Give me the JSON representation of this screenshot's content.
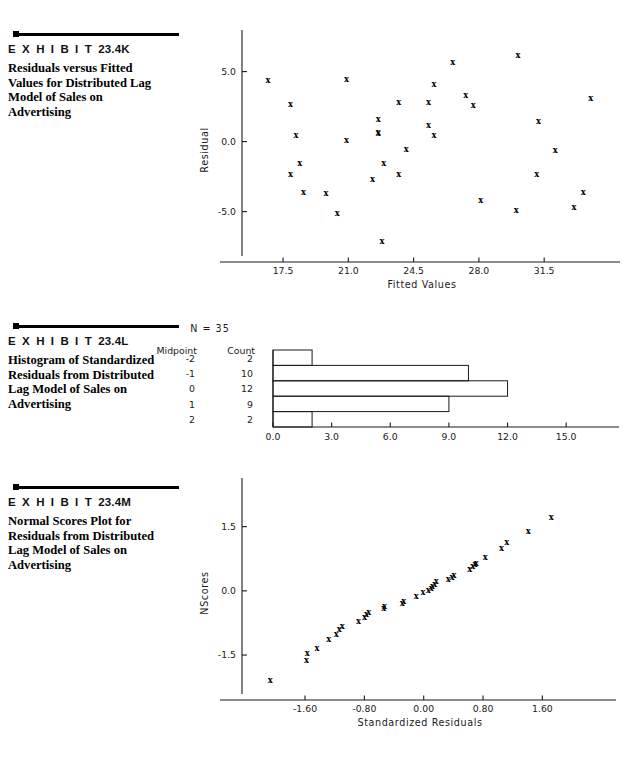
{
  "exhibits": [
    {
      "id": "23.4K",
      "label": "E X H I B I T",
      "number": "23.4K",
      "description": "Residuals versus Fitted Values for Distributed Lag Model of Sales on Advertising"
    },
    {
      "id": "23.4L",
      "label": "E X H I B I T",
      "number": "23.4L",
      "description": "Histogram of Standardized Residuals from Distributed Lag Model of Sales on Advertising"
    },
    {
      "id": "23.4M",
      "label": "E X H I B I T",
      "number": "23.4M",
      "description": "Normal Scores Plot for Residuals from Distributed Lag Model of Sales on Advertising"
    }
  ],
  "histogram_header": "N  =  35",
  "histogram_columns": {
    "midpoint": "Midpoint",
    "count": "Count"
  },
  "chart_data": [
    {
      "type": "scatter",
      "title": "Residuals versus Fitted Values for Distributed Lag Model of Sales on Advertising",
      "xlabel": "Fitted  Values",
      "ylabel": "Residual",
      "xlim": [
        15.3,
        34.6
      ],
      "ylim": [
        -8.6,
        7.4
      ],
      "xticks": [
        "17.5",
        "21.0",
        "24.5",
        "28.0",
        "31.5"
      ],
      "xtickvals": [
        17.5,
        21.0,
        24.5,
        28.0,
        31.5
      ],
      "yticks": [
        "5.0",
        "0.0",
        "-5.0"
      ],
      "ytickvals": [
        5.0,
        0.0,
        -5.0
      ],
      "grid": false,
      "marker": "x",
      "points": [
        [
          16.7,
          4.4
        ],
        [
          17.9,
          2.7
        ],
        [
          18.2,
          0.5
        ],
        [
          17.9,
          -2.3
        ],
        [
          18.4,
          -1.5
        ],
        [
          18.6,
          -3.6
        ],
        [
          19.8,
          -3.7
        ],
        [
          20.4,
          -5.1
        ],
        [
          20.9,
          4.5
        ],
        [
          20.9,
          0.1
        ],
        [
          22.3,
          -2.7
        ],
        [
          22.6,
          1.6
        ],
        [
          22.6,
          0.6
        ],
        [
          22.6,
          0.7
        ],
        [
          22.9,
          -1.5
        ],
        [
          22.8,
          -7.1
        ],
        [
          23.7,
          2.8
        ],
        [
          23.7,
          -2.3
        ],
        [
          24.1,
          -0.5
        ],
        [
          25.3,
          2.8
        ],
        [
          25.3,
          1.2
        ],
        [
          25.6,
          4.1
        ],
        [
          25.6,
          0.5
        ],
        [
          26.6,
          5.7
        ],
        [
          27.3,
          3.3
        ],
        [
          27.7,
          2.6
        ],
        [
          28.1,
          -4.2
        ],
        [
          30.1,
          6.2
        ],
        [
          30.0,
          -4.9
        ],
        [
          31.2,
          1.5
        ],
        [
          31.1,
          -2.3
        ],
        [
          32.1,
          -0.6
        ],
        [
          33.1,
          -4.7
        ],
        [
          33.6,
          -3.6
        ],
        [
          34.0,
          3.1
        ]
      ]
    },
    {
      "type": "bar",
      "orientation": "horizontal",
      "title": "Histogram of Standardized Residuals from Distributed Lag Model of Sales on Advertising",
      "categories": [
        "-2",
        "-1",
        "0",
        "1",
        "2"
      ],
      "values": [
        2,
        10,
        12,
        9,
        2
      ],
      "xlabel": "",
      "ylabel": "",
      "xticks": [
        "0.0",
        "3.0",
        "6.0",
        "9.0",
        "12.0",
        "15.0"
      ],
      "xtickvals": [
        0.0,
        3.0,
        6.0,
        9.0,
        12.0,
        15.0
      ],
      "xlim": [
        0,
        17.6
      ],
      "grid": false,
      "n": 35
    },
    {
      "type": "scatter",
      "title": "Normal Scores Plot for Residuals from Distributed Lag Model of Sales on Advertising",
      "xlabel": "Standardized  Residuals",
      "ylabel": "NScores",
      "xlim": [
        -2.45,
        2.35
      ],
      "ylim": [
        -2.55,
        2.45
      ],
      "xticks": [
        "-1.60",
        "-0.80",
        "0.00",
        "0.80",
        "1.60"
      ],
      "xtickvals": [
        -1.6,
        -0.8,
        0.0,
        0.8,
        1.6
      ],
      "yticks": [
        "1.5",
        "0.0",
        "-1.5"
      ],
      "ytickvals": [
        1.5,
        0.0,
        -1.5
      ],
      "grid": false,
      "marker": "x",
      "points": [
        [
          -2.07,
          -2.08
        ],
        [
          -1.58,
          -1.62
        ],
        [
          -1.57,
          -1.45
        ],
        [
          -1.44,
          -1.33
        ],
        [
          -1.28,
          -1.13
        ],
        [
          -1.18,
          -1.0
        ],
        [
          -1.14,
          -0.9
        ],
        [
          -1.1,
          -0.83
        ],
        [
          -0.88,
          -0.71
        ],
        [
          -0.8,
          -0.6
        ],
        [
          -0.77,
          -0.53
        ],
        [
          -0.74,
          -0.49
        ],
        [
          -0.54,
          -0.4
        ],
        [
          -0.53,
          -0.35
        ],
        [
          -0.29,
          -0.28
        ],
        [
          -0.27,
          -0.23
        ],
        [
          -0.1,
          -0.13
        ],
        [
          -0.01,
          -0.02
        ],
        [
          0.06,
          0.02
        ],
        [
          0.1,
          0.07
        ],
        [
          0.12,
          0.12
        ],
        [
          0.15,
          0.17
        ],
        [
          0.17,
          0.22
        ],
        [
          0.33,
          0.28
        ],
        [
          0.38,
          0.33
        ],
        [
          0.41,
          0.37
        ],
        [
          0.62,
          0.5
        ],
        [
          0.66,
          0.57
        ],
        [
          0.69,
          0.62
        ],
        [
          0.71,
          0.66
        ],
        [
          0.83,
          0.79
        ],
        [
          1.05,
          1.0
        ],
        [
          1.12,
          1.14
        ],
        [
          1.41,
          1.39
        ],
        [
          1.72,
          1.72
        ]
      ]
    }
  ]
}
